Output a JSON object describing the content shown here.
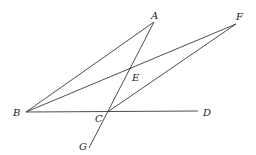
{
  "diagram": {
    "type": "geometry",
    "points": [
      {
        "id": "A",
        "label": "A",
        "x": 154,
        "y": 22,
        "lx": 151,
        "ly": 19
      },
      {
        "id": "F",
        "label": "F",
        "x": 236,
        "y": 24,
        "lx": 236,
        "ly": 20
      },
      {
        "id": "B",
        "label": "B",
        "x": 26,
        "y": 112,
        "lx": 13,
        "ly": 116
      },
      {
        "id": "C",
        "label": "C",
        "x": 109,
        "y": 111,
        "lx": 95,
        "ly": 122
      },
      {
        "id": "E",
        "label": "E",
        "x": 133,
        "y": 72,
        "lx": 132,
        "ly": 81
      },
      {
        "id": "D",
        "label": "D",
        "x": 198,
        "y": 111,
        "lx": 203,
        "ly": 116
      },
      {
        "id": "G",
        "label": "G",
        "x": 89,
        "y": 148,
        "lx": 79,
        "ly": 150
      }
    ],
    "segments": [
      {
        "from": "B",
        "to": "A"
      },
      {
        "from": "B",
        "to": "F"
      },
      {
        "from": "A",
        "to": "G"
      },
      {
        "from": "F",
        "to": "C"
      },
      {
        "from": "B",
        "to": "D"
      }
    ],
    "labels": {
      "A": "A",
      "B": "B",
      "C": "C",
      "D": "D",
      "E": "E",
      "F": "F",
      "G": "G"
    }
  }
}
